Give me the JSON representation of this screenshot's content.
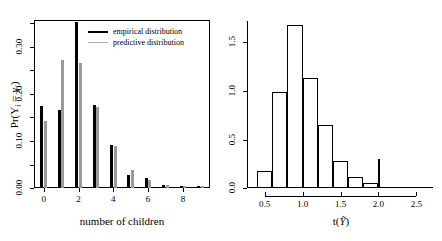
{
  "figure": {
    "width": 442,
    "height": 241,
    "background": "#ffffff",
    "panel_count": 2
  },
  "colors": {
    "empirical": "#000000",
    "predictive": "#9a9a9a",
    "axis": "#000000",
    "histogram_outline": "#000000",
    "reference_line": "#000000"
  },
  "left_panel": {
    "xlabel": "number of children",
    "ylabel": "Pr(Y",
    "ylabel_sub1": "i",
    "ylabel_mid": " = y",
    "ylabel_sub2": "i",
    "ylabel_end": ")",
    "x_ticks": [
      "0",
      "2",
      "4",
      "6",
      "8"
    ],
    "x_tick_values": [
      0,
      2,
      4,
      6,
      8
    ],
    "y_ticks": [
      "0.00",
      "0.10",
      "0.20",
      "0.30"
    ],
    "y_tick_values": [
      0.0,
      0.1,
      0.2,
      0.3
    ],
    "legend": {
      "items": [
        {
          "label": "empirical distribution",
          "color": "#000000",
          "style": "thick"
        },
        {
          "label": "predictive distribution",
          "color": "#aaaaaa",
          "style": "thin"
        }
      ]
    }
  },
  "right_panel": {
    "xlabel_prefix": "t(",
    "xlabel_symbol": "Ỹ",
    "xlabel_suffix": ")",
    "x_ticks": [
      "0.5",
      "1.0",
      "1.5",
      "2.0",
      "2.5"
    ],
    "x_tick_values": [
      0.5,
      1.0,
      1.5,
      2.0,
      2.5
    ],
    "y_ticks": [
      "0.0",
      "0.5",
      "1.0",
      "1.5"
    ],
    "y_tick_values": [
      0.0,
      0.5,
      1.0,
      1.5
    ]
  },
  "chart_data": [
    {
      "type": "bar",
      "title": "",
      "subtitle": "",
      "panel": "left",
      "xlabel": "number of children",
      "ylabel": "Pr(Y_i = y_i)",
      "categories": [
        "0",
        "1",
        "2",
        "3",
        "4",
        "5",
        "6",
        "7",
        "8",
        "9"
      ],
      "x": [
        0,
        1,
        2,
        3,
        4,
        5,
        6,
        7,
        8,
        9
      ],
      "xlim": [
        -0.5,
        9.5
      ],
      "ylim": [
        0.0,
        0.355
      ],
      "grid": false,
      "legend_position": "top-right",
      "series": [
        {
          "name": "empirical distribution",
          "color": "#000000",
          "values": [
            0.175,
            0.165,
            0.352,
            0.177,
            0.092,
            0.028,
            0.022,
            0.006,
            0.005,
            0.005
          ]
        },
        {
          "name": "predictive distribution",
          "color": "#9a9a9a",
          "values": [
            0.142,
            0.272,
            0.265,
            0.173,
            0.09,
            0.038,
            0.017,
            0.006,
            0.004,
            0.004
          ]
        }
      ]
    },
    {
      "type": "histogram",
      "title": "",
      "panel": "right",
      "xlabel": "t(Ỹ)",
      "ylabel": "",
      "xlim": [
        0.28,
        2.72
      ],
      "ylim": [
        0.0,
        1.72
      ],
      "grid": false,
      "legend_position": "none",
      "bin_edges": [
        0.4,
        0.6,
        0.8,
        1.0,
        1.2,
        1.4,
        1.6,
        1.8,
        2.0
      ],
      "densities": [
        0.18,
        0.99,
        1.68,
        1.13,
        0.65,
        0.28,
        0.11,
        0.05
      ],
      "annotations": [
        {
          "type": "vertical-line",
          "label": "observed statistic",
          "x": 2.0,
          "y_top": 0.3
        }
      ]
    }
  ]
}
